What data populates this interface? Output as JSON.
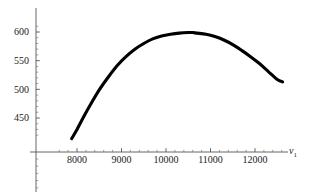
{
  "chart_data": {
    "type": "line",
    "title": "",
    "subtitle": "",
    "xlabel": "v1",
    "xlabel_base": "v",
    "xlabel_sub": "1",
    "ylabel": "",
    "xlim": [
      7450,
      12900
    ],
    "ylim": [
      415,
      612
    ],
    "grid": false,
    "legend": null,
    "xticks": [
      8000,
      9000,
      10000,
      11000,
      12000
    ],
    "xtick_labels": [
      "8000",
      "9000",
      "10000",
      "11000",
      "12000"
    ],
    "yticks": [
      450,
      500,
      550,
      600
    ],
    "ytick_labels": [
      "450",
      "500",
      "550",
      "600"
    ],
    "x_minor_step": 200,
    "y_minor_step": 10,
    "curve_color": "#000000",
    "axis_color": "#555555",
    "series": [
      {
        "name": "curve",
        "x": [
          7880,
          8000,
          8150,
          8300,
          8500,
          8700,
          8900,
          9100,
          9300,
          9500,
          9700,
          9900,
          10100,
          10300,
          10500,
          10600,
          10700,
          10900,
          11100,
          11300,
          11500,
          11700,
          11900,
          12100,
          12300,
          12500,
          12620
        ],
        "y": [
          414,
          430,
          452,
          473,
          499,
          521,
          541,
          557,
          570,
          580,
          588,
          593,
          596,
          598,
          599,
          599,
          598,
          596,
          592,
          586,
          578,
          568,
          557,
          545,
          531,
          517,
          513
        ]
      }
    ],
    "annotations": [
      {
        "text": "x-intercept near 8150",
        "x": 8150,
        "y": 450
      },
      {
        "text": "maximum near (10600, 599)",
        "x": 10600,
        "y": 599
      }
    ]
  }
}
